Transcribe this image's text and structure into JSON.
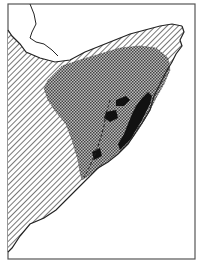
{
  "map": {
    "region": "Horn of Africa",
    "colors": {
      "background": "#ffffff",
      "frame": "#555555",
      "coastline": "#222222",
      "hatch": "#555555",
      "crosshatch": "#444444",
      "solid": "#111111"
    },
    "layers": [
      {
        "name": "diagonal-hatch-zone",
        "pattern": "diagonal-lines"
      },
      {
        "name": "crosshatch-zone",
        "pattern": "checker"
      },
      {
        "name": "solid-black-zone",
        "pattern": "solid"
      }
    ]
  }
}
